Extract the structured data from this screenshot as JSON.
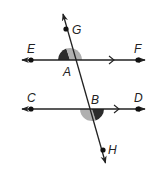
{
  "diagram": {
    "type": "parallel-lines-cut-by-transversal",
    "colors": {
      "line": "#222222",
      "point": "#111111",
      "dark_angle": "#2b2b2b",
      "light_angle": "#b0b0b0"
    },
    "lines": [
      {
        "name": "line-EF",
        "points": [
          "E",
          "A",
          "F"
        ],
        "parallel_marker": ">"
      },
      {
        "name": "line-CD",
        "points": [
          "C",
          "B",
          "D"
        ],
        "parallel_marker": ">"
      },
      {
        "name": "transversal-GH",
        "points": [
          "G",
          "A",
          "B",
          "H"
        ]
      }
    ],
    "points": {
      "G": {
        "label": "G"
      },
      "E": {
        "label": "E"
      },
      "F": {
        "label": "F"
      },
      "A": {
        "label": "A"
      },
      "C": {
        "label": "C"
      },
      "B": {
        "label": "B"
      },
      "D": {
        "label": "D"
      },
      "H": {
        "label": "H"
      }
    },
    "shaded_angles": [
      {
        "vertex": "A",
        "between": [
          "G",
          "E"
        ],
        "shade": "dark"
      },
      {
        "vertex": "A",
        "between": [
          "G",
          "F"
        ],
        "shade": "light"
      },
      {
        "vertex": "B",
        "between": [
          "C",
          "H"
        ],
        "shade": "light"
      },
      {
        "vertex": "B",
        "between": [
          "D",
          "H"
        ],
        "shade": "dark"
      }
    ]
  }
}
